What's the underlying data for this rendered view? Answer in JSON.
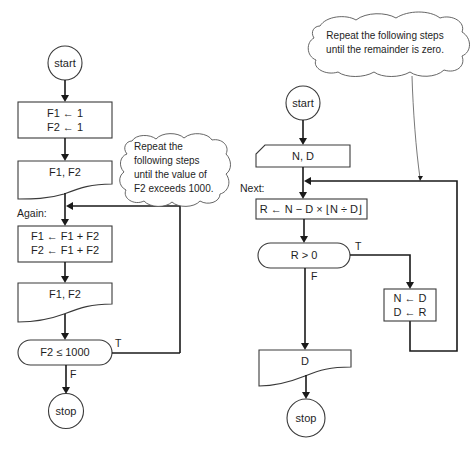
{
  "left_flowchart": {
    "start": "start",
    "init": [
      "F1 ← 1",
      "F2 ← 1"
    ],
    "output1": "F1, F2",
    "loop_label": "Again:",
    "compute": [
      "F1 ← F1 + F2",
      "F2 ← F1 + F2"
    ],
    "output2": "F1, F2",
    "decision": "F2 ≤ 1000",
    "true_label": "T",
    "false_label": "F",
    "stop": "stop",
    "note": [
      "Repeat the",
      "following steps",
      "until the value of",
      "F2 exceeds 1000."
    ]
  },
  "right_flowchart": {
    "start": "start",
    "input": "N, D",
    "loop_label": "Next:",
    "compute": "R ← N − D × ⌊N ÷ D⌋",
    "decision": "R > 0",
    "true_label": "T",
    "false_label": "F",
    "swap": [
      "N ← D",
      "D ← R"
    ],
    "output": "D",
    "stop": "stop",
    "note": [
      "Repeat the following steps",
      "until the remainder is zero."
    ]
  },
  "colors": {
    "line": "#1a1a1a",
    "shape_border": "#3a3a3a",
    "background": "#ffffff"
  }
}
